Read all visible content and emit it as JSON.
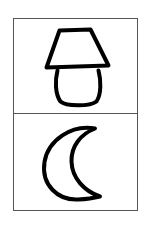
{
  "card": {
    "title": "Lamp and moon pictogram card",
    "background_color": "#ffffff",
    "frame": {
      "name": "outer-frame",
      "x": 13,
      "y": 18,
      "width": 125,
      "height": 193,
      "stroke_color": "#555555",
      "stroke_width": 1,
      "fill_color": "#ffffff"
    },
    "divider": {
      "name": "panel-divider",
      "y": 113,
      "x1": 13,
      "x2": 138,
      "stroke_color": "#555555",
      "stroke_width": 1
    }
  },
  "panels": [
    {
      "id": "lamp",
      "label": "Lamp",
      "cell_index": 1,
      "cell": {
        "x": 13,
        "y": 18,
        "width": 125,
        "height": 95
      },
      "icon_name": "lamp-icon",
      "stroke_color": "#000000",
      "stroke_width": 4,
      "parts": [
        {
          "name": "lampshade",
          "shape": "trapezoid",
          "top_left_x": 59,
          "top_right_x": 91,
          "top_y": 30,
          "bottom_left_x": 45,
          "bottom_right_x": 109,
          "bottom_y": 67,
          "path": "M 59.5 30.5 L 90.5 29.5 L 108.5 65.5 L 46.5 67.5 Z"
        },
        {
          "name": "lamp-base",
          "shape": "rounded-barrel",
          "top_y": 70,
          "bottom_y": 105,
          "left_x": 55,
          "right_x": 101,
          "top_left_x": 57,
          "top_right_x": 99,
          "bottom_left_x": 60,
          "bottom_right_x": 97,
          "path": "M 57.5 70.5 C 55 80 55 94 60.5 101.5 C 66 106.5 90 106.5 96.5 101.5 C 101.5 94 101 80 98.5 70.5"
        }
      ]
    },
    {
      "id": "moon",
      "label": "Crescent moon",
      "cell_index": 2,
      "cell": {
        "x": 13,
        "y": 113,
        "width": 125,
        "height": 98
      },
      "icon_name": "crescent-moon-icon",
      "stroke_color": "#000000",
      "stroke_width": 4,
      "opening_direction": "right",
      "parts": [
        {
          "name": "crescent-outline",
          "shape": "crescent",
          "top_tip_x": 95,
          "top_tip_y": 128,
          "bottom_tip_x": 100,
          "bottom_tip_y": 197,
          "outer_left_x": 44,
          "outer_bottom_y": 200,
          "inner_waist_x": 76,
          "path": "M 95 128.5 C 72 124 48 140 44.5 162 C 41 185 58 200.5 78 199.5 C 88 199 96 197.5 100 196.5 C 84 191 72 178 71.5 161.5 C 71 146 81 134 95 128.5 Z"
        }
      ]
    }
  ]
}
